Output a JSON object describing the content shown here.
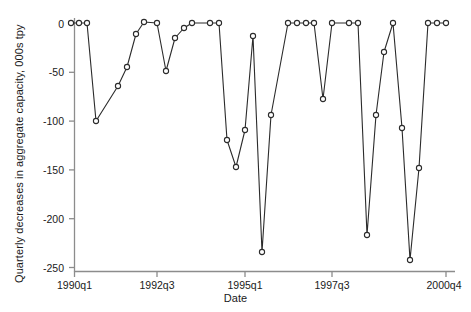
{
  "chart_data": {
    "type": "line",
    "title": "",
    "xlabel": "Date",
    "ylabel": "Quarterly decreases in aggregate capacity, 000s tpy",
    "x_tick_labels": [
      "1990q1",
      "1992q3",
      "1995q1",
      "1997q3",
      "2000q4"
    ],
    "x_tick_values": [
      "1990q1",
      "1992q3",
      "1995q1",
      "1997q3",
      "2000q4"
    ],
    "y_tick_labels": [
      "0",
      "-50",
      "-100",
      "-150",
      "-200",
      "-250"
    ],
    "y_tick_values": [
      0,
      -50,
      -100,
      -150,
      -200,
      -250
    ],
    "ylim": [
      -262,
      8
    ],
    "grid": false,
    "legend": false,
    "marker": "open-circle",
    "line_color": "#2b2b2b",
    "categories": [
      "1990q1",
      "1990q2",
      "1990q3",
      "1990q4",
      "1991q1",
      "1991q2",
      "1991q3",
      "1991q4",
      "1992q1",
      "1992q2",
      "1992q3",
      "1992q4",
      "1993q1",
      "1993q2",
      "1993q3",
      "1993q4",
      "1994q1",
      "1994q2",
      "1994q3",
      "1994q4",
      "1995q1",
      "1995q2",
      "1995q3",
      "1995q4",
      "1996q1",
      "1996q2",
      "1996q3",
      "1996q4",
      "1997q1",
      "1997q2",
      "1997q3",
      "1997q4",
      "1998q1",
      "1998q2",
      "1998q3",
      "1998q4",
      "1999q1",
      "1999q2",
      "1999q3",
      "1999q4",
      "2000q1",
      "2000q2",
      "2000q3",
      "2000q4"
    ],
    "values": [
      0,
      0,
      0,
      -100,
      -64,
      -45,
      -12,
      0,
      0,
      -49,
      -15,
      -7,
      0,
      0,
      -46,
      -120,
      -147,
      -110,
      -14,
      -235,
      -95,
      0,
      0,
      0,
      0,
      -78,
      0,
      0,
      0,
      -218,
      -95,
      -30,
      0,
      -108,
      -243,
      -148,
      0,
      0,
      0,
      -245,
      0,
      0,
      0,
      0
    ],
    "points": [
      {
        "x": "1990q1",
        "y": 0
      },
      {
        "x": "1990q2",
        "y": 0
      },
      {
        "x": "1990q3",
        "y": 0
      },
      {
        "x": "1990q4",
        "y": -100
      },
      {
        "x": "1991q2",
        "y": -64
      },
      {
        "x": "1991q3",
        "y": -45
      },
      {
        "x": "1991q4",
        "y": -12
      },
      {
        "x": "1992q1",
        "y": 0
      },
      {
        "x": "1992q2",
        "y": 0
      },
      {
        "x": "1992q3",
        "y": -49
      },
      {
        "x": "1992q4",
        "y": -15
      },
      {
        "x": "1993q1",
        "y": -7
      },
      {
        "x": "1993q2",
        "y": 0
      },
      {
        "x": "1993q3",
        "y": 0
      },
      {
        "x": "1993q4",
        "y": 0
      },
      {
        "x": "1994q1",
        "y": -120
      },
      {
        "x": "1994q2",
        "y": -147
      },
      {
        "x": "1994q3",
        "y": -110
      },
      {
        "x": "1994q4",
        "y": -14
      },
      {
        "x": "1995q1",
        "y": -235
      },
      {
        "x": "1995q2",
        "y": -95
      },
      {
        "x": "1995q4",
        "y": 0
      },
      {
        "x": "1996q1",
        "y": 0
      },
      {
        "x": "1996q2",
        "y": 0
      },
      {
        "x": "1996q3",
        "y": -78
      },
      {
        "x": "1997q1",
        "y": 0
      },
      {
        "x": "1997q2",
        "y": 0
      },
      {
        "x": "1997q3",
        "y": 0
      },
      {
        "x": "1997q4",
        "y": -218
      },
      {
        "x": "1998q1",
        "y": -95
      },
      {
        "x": "1998q2",
        "y": -30
      },
      {
        "x": "1998q3",
        "y": 0
      },
      {
        "x": "1998q4",
        "y": -108
      },
      {
        "x": "1999q1",
        "y": -243
      },
      {
        "x": "1999q2",
        "y": -148
      },
      {
        "x": "1999q3",
        "y": 0
      },
      {
        "x": "1999q4",
        "y": 0
      },
      {
        "x": "2000q3",
        "y": 0
      },
      {
        "x": "2000q4",
        "y": 0
      }
    ],
    "series_pixels": [
      [
        71,
        23
      ],
      [
        79,
        23
      ],
      [
        87,
        23
      ],
      [
        96,
        121
      ],
      [
        118,
        86
      ],
      [
        127,
        67
      ],
      [
        136,
        34
      ],
      [
        144,
        22
      ],
      [
        157,
        23
      ],
      [
        166,
        71
      ],
      [
        175,
        38
      ],
      [
        184,
        28
      ],
      [
        192,
        23
      ],
      [
        210,
        23
      ],
      [
        219,
        23
      ],
      [
        227,
        140
      ],
      [
        236,
        167
      ],
      [
        245,
        130
      ],
      [
        253,
        36
      ],
      [
        262,
        252
      ],
      [
        271,
        115
      ],
      [
        288,
        23
      ],
      [
        297,
        23
      ],
      [
        306,
        23
      ],
      [
        314,
        23
      ],
      [
        323,
        99
      ],
      [
        332,
        23
      ],
      [
        349,
        23
      ],
      [
        358,
        23
      ],
      [
        367,
        235
      ],
      [
        376,
        115
      ],
      [
        384,
        52
      ],
      [
        393,
        23
      ],
      [
        402,
        128
      ],
      [
        410,
        260
      ],
      [
        419,
        168
      ],
      [
        428,
        23
      ],
      [
        437,
        23
      ],
      [
        446,
        23
      ]
    ]
  }
}
